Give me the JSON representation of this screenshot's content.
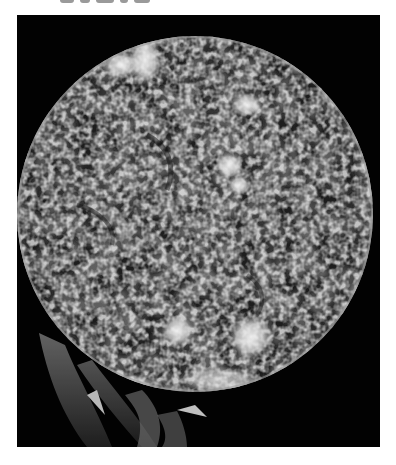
{
  "image": {
    "subject": "sun-disk",
    "description": "Grayscale image of the Sun showing mottled chromosphere texture, bright plage regions, and prominences at the lower-left limb",
    "colors": {
      "background": "#ffffff",
      "frame": "#020202",
      "disk_mid": "#6e6e6e",
      "disk_dark": "#2a2a2a",
      "plage_bright": "#f2f2f2"
    },
    "frame": {
      "x": 17,
      "y": 15,
      "width": 363,
      "height": 432
    },
    "disk": {
      "cx": 178,
      "cy": 199,
      "r": 178
    },
    "bright_regions": [
      {
        "name": "plage-top-left",
        "cx": 48,
        "cy": 38,
        "rx": 12,
        "ry": 10
      },
      {
        "name": "plage-top-center",
        "cx": 105,
        "cy": 47,
        "rx": 16,
        "ry": 12
      },
      {
        "name": "plage-top-right",
        "cx": 125,
        "cy": 40,
        "rx": 14,
        "ry": 22
      },
      {
        "name": "plage-upper-right",
        "cx": 230,
        "cy": 90,
        "rx": 14,
        "ry": 10
      },
      {
        "name": "plage-center",
        "cx": 215,
        "cy": 160,
        "rx": 14,
        "ry": 16
      },
      {
        "name": "plage-lower-left",
        "cx": 160,
        "cy": 315,
        "rx": 14,
        "ry": 14
      },
      {
        "name": "plage-lower-right",
        "cx": 233,
        "cy": 323,
        "rx": 18,
        "ry": 20
      },
      {
        "name": "plage-bottom",
        "cx": 200,
        "cy": 380,
        "rx": 30,
        "ry": 8
      }
    ]
  }
}
